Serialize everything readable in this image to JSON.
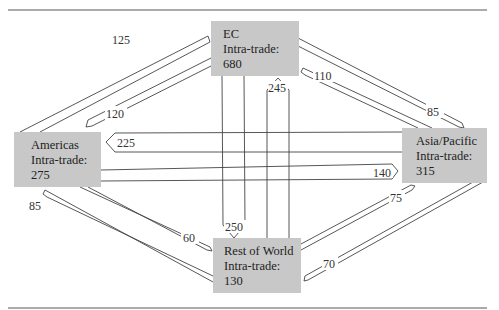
{
  "regions": {
    "ec": {
      "name": "EC",
      "label": "Intra-trade:",
      "value": "680"
    },
    "americas": {
      "name": "Americas",
      "label": "Intra-trade:",
      "value": "275"
    },
    "asia_pacific": {
      "name": "Asia/Pacific",
      "label": "Intra-trade:",
      "value": "315"
    },
    "rest_of_world": {
      "name": "Rest of World",
      "label": "Intra-trade:",
      "value": "130"
    }
  },
  "flows": [
    {
      "from": "Americas",
      "to": "EC",
      "value": "125"
    },
    {
      "from": "EC",
      "to": "Americas",
      "value": "120"
    },
    {
      "from": "EC",
      "to": "Asia/Pacific",
      "value": "85"
    },
    {
      "from": "Asia/Pacific",
      "to": "EC",
      "value": "110"
    },
    {
      "from": "Asia/Pacific",
      "to": "Americas",
      "value": "225"
    },
    {
      "from": "Americas",
      "to": "Asia/Pacific",
      "value": "140"
    },
    {
      "from": "EC",
      "to": "Rest of World",
      "value": "250"
    },
    {
      "from": "Rest of World",
      "to": "EC",
      "value": "245"
    },
    {
      "from": "Rest of World",
      "to": "Americas",
      "value": "85"
    },
    {
      "from": "Americas",
      "to": "Rest of World",
      "value": "60"
    },
    {
      "from": "Rest of World",
      "to": "Asia/Pacific",
      "value": "75"
    },
    {
      "from": "Asia/Pacific",
      "to": "Rest of World",
      "value": "70"
    }
  ]
}
